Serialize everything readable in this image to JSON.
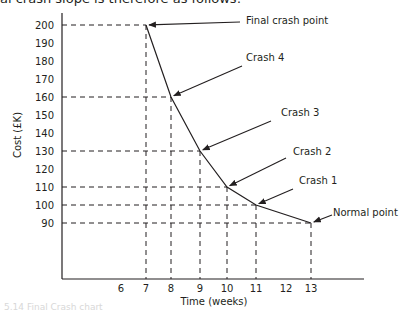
{
  "intro_text": "al crash slope is therefore as follows:",
  "caption": "5.14  Final Crash chart",
  "chart_data": {
    "type": "line",
    "title": "",
    "xlabel": "Time (weeks)",
    "ylabel": "Cost (£K)",
    "x_ticks": [
      6,
      7,
      8,
      9,
      10,
      11,
      12,
      13
    ],
    "y_ticks": [
      90,
      100,
      110,
      120,
      130,
      140,
      150,
      160,
      170,
      180,
      190,
      200
    ],
    "xlim": [
      4,
      15
    ],
    "ylim": [
      70,
      205
    ],
    "grid": false,
    "points": [
      {
        "label": "Final crash point",
        "x": 7,
        "y": 200
      },
      {
        "label": "Crash 4",
        "x": 8,
        "y": 160
      },
      {
        "label": "Crash 3",
        "x": 9,
        "y": 130
      },
      {
        "label": "Crash 2",
        "x": 10,
        "y": 110
      },
      {
        "label": "Crash 1",
        "x": 11,
        "y": 100
      },
      {
        "label": "Normal point",
        "x": 13,
        "y": 90
      }
    ],
    "x": [
      7,
      8,
      9,
      10,
      11,
      13
    ],
    "series": [
      {
        "name": "Cost vs time",
        "values": [
          200,
          160,
          130,
          110,
          100,
          90
        ]
      }
    ],
    "dashed_projection_lines": true
  }
}
